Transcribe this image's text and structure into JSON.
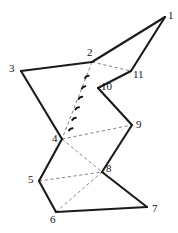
{
  "figure": {
    "type": "geometric-polygon-diagram",
    "width": 178,
    "height": 233,
    "background_color": "#ffffff",
    "solid_stroke_color": "#1a1a1a",
    "dashed_stroke_color": "#6e6e6e",
    "label_color": "#161616",
    "vertices": [
      {
        "id": "1",
        "label": "1",
        "x": 165,
        "y": 17,
        "label_x": 168,
        "label_y": 10
      },
      {
        "id": "2",
        "label": "2",
        "x": 92,
        "y": 62,
        "label_x": 87,
        "label_y": 47
      },
      {
        "id": "3",
        "label": "3",
        "x": 21,
        "y": 71,
        "label_x": 9,
        "label_y": 63
      },
      {
        "id": "4",
        "label": "4",
        "x": 62,
        "y": 139,
        "label_x": 52,
        "label_y": 133
      },
      {
        "id": "5",
        "label": "5",
        "x": 39,
        "y": 181,
        "label_x": 28,
        "label_y": 174
      },
      {
        "id": "6",
        "label": "6",
        "x": 56,
        "y": 212,
        "label_x": 50,
        "label_y": 214
      },
      {
        "id": "7",
        "label": "7",
        "x": 147,
        "y": 207,
        "label_x": 152,
        "label_y": 203
      },
      {
        "id": "8",
        "label": "8",
        "x": 102,
        "y": 172,
        "label_x": 106,
        "label_y": 163
      },
      {
        "id": "9",
        "label": "9",
        "x": 132,
        "y": 125,
        "label_x": 136,
        "label_y": 119
      },
      {
        "id": "10",
        "label": "10",
        "x": 98,
        "y": 88,
        "label_x": 101,
        "label_y": 81
      },
      {
        "id": "11",
        "label": "11",
        "x": 131,
        "y": 71,
        "label_x": 133,
        "label_y": 69
      }
    ],
    "solid_edges": [
      {
        "from": "3",
        "to": "2"
      },
      {
        "from": "2",
        "to": "1"
      },
      {
        "from": "1",
        "to": "11"
      },
      {
        "from": "11",
        "to": "10"
      },
      {
        "from": "10",
        "to": "9"
      },
      {
        "from": "9",
        "to": "8"
      },
      {
        "from": "8",
        "to": "7"
      },
      {
        "from": "7",
        "to": "6"
      },
      {
        "from": "6",
        "to": "5"
      },
      {
        "from": "5",
        "to": "4"
      },
      {
        "from": "4",
        "to": "3"
      }
    ],
    "dashed_edges": [
      {
        "from": "2",
        "to": "11"
      },
      {
        "from": "2",
        "to": "4"
      },
      {
        "from": "4",
        "to": "9"
      },
      {
        "from": "4",
        "to": "8"
      },
      {
        "from": "5",
        "to": "8"
      },
      {
        "from": "6",
        "to": "8"
      }
    ],
    "angle_ticks_on_edge": {
      "from": "2",
      "to": "4",
      "count": 6
    }
  }
}
